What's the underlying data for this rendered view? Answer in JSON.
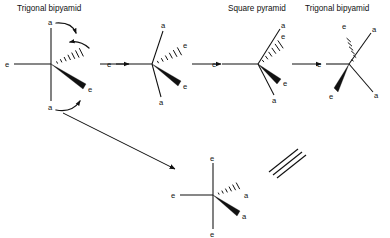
{
  "figure": {
    "kind": "chemistry-mechanism-diagram",
    "topic": "Berry pseudorotation interconversion of trigonal bipyramidal and square pyramidal geometries",
    "width": 390,
    "height": 238,
    "background_color": "#ffffff",
    "ink_color": "#111111"
  },
  "titles": [
    {
      "id": "title-1",
      "text": "Trigonal bipyamid",
      "x": 17,
      "y": 11
    },
    {
      "id": "title-2",
      "text": "Square pyramid",
      "x": 228,
      "y": 11
    },
    {
      "id": "title-3",
      "text": "Trigonal bipyamid",
      "x": 305,
      "y": 11
    }
  ],
  "structures": [
    {
      "id": "structure-1",
      "name": "trigonal-bipyramid-start",
      "center": {
        "x": 51,
        "y": 64
      },
      "labels": [
        {
          "text": "a",
          "x": 48,
          "y": 25,
          "role": "axial-top"
        },
        {
          "text": "a",
          "x": 48,
          "y": 107,
          "role": "axial-bottom"
        },
        {
          "text": "e",
          "x": 6,
          "y": 67,
          "role": "equatorial-left"
        },
        {
          "text": "e",
          "x": 92,
          "y": 85,
          "role": "equatorial-wedge"
        }
      ],
      "bond_types": [
        "plain-vertical-axial",
        "plain-horizontal-equatorial",
        "hashed-wedge-equatorial",
        "solid-wedge-equatorial"
      ]
    },
    {
      "id": "structure-2",
      "name": "trigonal-bipyramid-bending",
      "center": {
        "x": 152,
        "y": 64
      },
      "labels": [
        {
          "text": "a",
          "x": 160,
          "y": 28,
          "role": "axial-upper"
        },
        {
          "text": "a",
          "x": 160,
          "y": 102,
          "role": "axial-lower"
        },
        {
          "text": "e",
          "x": 108,
          "y": 67,
          "role": "equatorial-left"
        },
        {
          "text": "e",
          "x": 181,
          "y": 46,
          "role": "equatorial-hash"
        },
        {
          "text": "e",
          "x": 181,
          "y": 84,
          "role": "equatorial-wedge"
        }
      ],
      "bond_types": [
        "plain-axial-upper",
        "plain-axial-lower",
        "plain-horizontal-equatorial",
        "hashed-wedge-equatorial",
        "solid-wedge-equatorial"
      ]
    },
    {
      "id": "structure-3",
      "name": "square-pyramid",
      "center": {
        "x": 258,
        "y": 64
      },
      "labels": [
        {
          "text": "a",
          "x": 281,
          "y": 26,
          "role": "axial-upper"
        },
        {
          "text": "e",
          "x": 281,
          "y": 37,
          "role": "equatorial-hash"
        },
        {
          "text": "e",
          "x": 283,
          "y": 83,
          "role": "equatorial-wedge"
        },
        {
          "text": "a",
          "x": 275,
          "y": 99,
          "role": "axial-lower"
        },
        {
          "text": "e",
          "x": 212,
          "y": 67,
          "role": "equatorial-left"
        }
      ],
      "bond_types": [
        "plain-axial-upper",
        "plain-axial-lower",
        "plain-horizontal-equatorial",
        "hashed-wedge-equatorial",
        "solid-wedge-equatorial"
      ]
    },
    {
      "id": "structure-4",
      "name": "trigonal-bipyramid-product",
      "center": {
        "x": 349,
        "y": 64
      },
      "labels": [
        {
          "text": "e",
          "x": 344,
          "y": 26,
          "role": "equatorial-hash"
        },
        {
          "text": "a",
          "x": 371,
          "y": 30,
          "role": "axial-upper"
        },
        {
          "text": "e",
          "x": 318,
          "y": 67,
          "role": "equatorial-left"
        },
        {
          "text": "e",
          "x": 331,
          "y": 96,
          "role": "equatorial-wedge"
        },
        {
          "text": "a",
          "x": 374,
          "y": 95,
          "role": "axial-lower"
        }
      ],
      "bond_types": [
        "plain-axial-upper",
        "plain-axial-lower",
        "plain-horizontal-equatorial",
        "hashed-wedge-equatorial",
        "solid-wedge-equatorial"
      ]
    },
    {
      "id": "structure-5",
      "name": "trigonal-bipyramid-rotated-equivalent",
      "center": {
        "x": 213,
        "y": 195
      },
      "labels": [
        {
          "text": "e",
          "x": 210,
          "y": 160,
          "role": "axis-top"
        },
        {
          "text": "e",
          "x": 210,
          "y": 234,
          "role": "axis-bottom"
        },
        {
          "text": "e",
          "x": 172,
          "y": 198,
          "role": "equatorial-left"
        },
        {
          "text": "a",
          "x": 245,
          "y": 196,
          "role": "hashed-wedge"
        },
        {
          "text": "a",
          "x": 242,
          "y": 216,
          "role": "solid-wedge"
        }
      ],
      "bond_types": [
        "plain-vertical",
        "plain-horizontal",
        "hashed-wedge",
        "solid-wedge"
      ]
    }
  ],
  "reaction_arrows": [
    {
      "id": "rxn-arrow-1",
      "from": "structure-1",
      "to": "structure-2",
      "x1": 100,
      "y1": 64,
      "x2": 131,
      "y2": 64,
      "direction": "right"
    },
    {
      "id": "rxn-arrow-2",
      "from": "structure-2",
      "to": "structure-3",
      "x1": 185,
      "y1": 64,
      "x2": 213,
      "y2": 64,
      "direction": "right"
    },
    {
      "id": "rxn-arrow-3",
      "from": "structure-3",
      "to": "structure-4",
      "x1": 290,
      "y1": 64,
      "x2": 317,
      "y2": 64,
      "direction": "right"
    },
    {
      "id": "rxn-arrow-diagonal",
      "from": "structure-1",
      "to": "structure-5",
      "x1": 63,
      "y1": 113,
      "x2": 172,
      "y2": 167,
      "direction": "down-right"
    }
  ],
  "curly_arrows": [
    {
      "id": "curly-arrow-top",
      "description": "axial a bends toward equatorial region",
      "start": {
        "x": 57,
        "y": 25
      },
      "end": {
        "x": 76,
        "y": 35
      }
    },
    {
      "id": "curly-arrow-middle",
      "description": "equatorial e opens toward axial position",
      "start": {
        "x": 88,
        "y": 49
      },
      "end": {
        "x": 70,
        "y": 43
      }
    },
    {
      "id": "curly-arrow-bottom",
      "description": "axial a bends toward equatorial e",
      "start": {
        "x": 57,
        "y": 108
      },
      "end": {
        "x": 82,
        "y": 99
      }
    }
  ],
  "equivalence_symbol": {
    "id": "equivalence-symbol",
    "glyph_name": "triple-parallel-lines",
    "meaning": "identical / equivalent structures",
    "line_count": 3,
    "x": 268,
    "y": 150,
    "width": 36,
    "height": 28
  },
  "legend": {
    "a": "axial position",
    "e": "equatorial position"
  }
}
